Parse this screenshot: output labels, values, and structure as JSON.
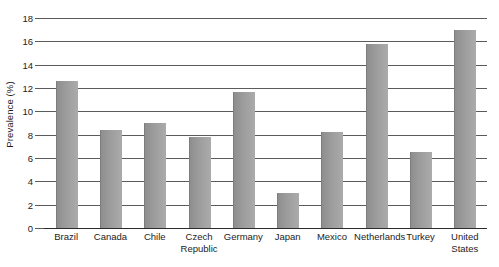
{
  "chart_data": {
    "type": "bar",
    "title": "",
    "subtitle": "",
    "xlabel": "",
    "ylabel": "Prevalence (%)",
    "ylim": [
      0,
      18
    ],
    "ytick_step": 2,
    "yticks": [
      0,
      2,
      4,
      6,
      8,
      10,
      12,
      14,
      16,
      18
    ],
    "ytick_labels": [
      "0",
      "2",
      "4",
      "6",
      "8",
      "10",
      "12",
      "14",
      "16",
      "18"
    ],
    "grid": true,
    "grid_axis": "y",
    "legend": false,
    "legend_position": "none",
    "categories": [
      "Brazil",
      "Canada",
      "Chile",
      "Czech Republic",
      "Germany",
      "Japan",
      "Mexico",
      "Netherlands",
      "Turkey",
      "United States"
    ],
    "values": [
      12.6,
      8.4,
      9.0,
      7.8,
      11.7,
      3.0,
      8.2,
      15.8,
      6.5,
      17.0
    ],
    "bar_color": "#9a9a9a",
    "axis_color": "#2b2b2b",
    "grid_color": "#5b5b5b",
    "text_color": "#1c1c1c",
    "background_color": "#ffffff"
  }
}
